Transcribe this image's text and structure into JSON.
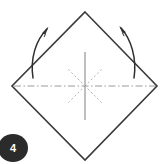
{
  "figure": {
    "kind": "origami-fold-diagram",
    "step_number": "4",
    "canvas": {
      "width": 164,
      "height": 164,
      "background": "#ffffff"
    }
  },
  "colors": {
    "paper_outline": "#3a3a3a",
    "crease_solid": "#8a8a8a",
    "crease_dashdot": "#9a9a9a",
    "crease_dotted": "#b4b4b4",
    "arrow": "#2e2e2e",
    "badge_fill": "#2b2b2b",
    "badge_text": "#ffffff"
  },
  "paper": {
    "label": "square-paper-diamond-orientation",
    "vertices": {
      "top": {
        "x": 85,
        "y": 12
      },
      "right": {
        "x": 157,
        "y": 86
      },
      "bottom": {
        "x": 85,
        "y": 160
      },
      "left": {
        "x": 12,
        "y": 86
      }
    },
    "path": "M 85 12 L 157 86 L 85 160 L 12 86 Z",
    "stroke_width": 1.6
  },
  "creases": {
    "center": {
      "x": 85,
      "y": 86
    },
    "vertical": {
      "label": "vertical-crease-line",
      "style": "solid",
      "x1": 85,
      "y1": 52,
      "x2": 85,
      "y2": 120,
      "stroke_width": 1.1
    },
    "horizontal": {
      "label": "horizontal-crease-line",
      "style": "dash-dot",
      "x1": 14,
      "y1": 86,
      "x2": 156,
      "y2": 86,
      "stroke_width": 1.0,
      "dash_pattern": "7,2.5,1.5,2.5"
    },
    "diagonals": [
      {
        "label": "diagonal-crease-nw",
        "style": "dotted",
        "x1": 85,
        "y1": 86,
        "x2": 68,
        "y2": 69
      },
      {
        "label": "diagonal-crease-ne",
        "style": "dotted",
        "x1": 85,
        "y1": 86,
        "x2": 102,
        "y2": 69
      },
      {
        "label": "diagonal-crease-sw",
        "style": "dotted",
        "x1": 85,
        "y1": 86,
        "x2": 68,
        "y2": 103
      },
      {
        "label": "diagonal-crease-se",
        "style": "dotted",
        "x1": 85,
        "y1": 86,
        "x2": 102,
        "y2": 103
      }
    ],
    "diagonal_stroke_width": 1.0,
    "diagonal_dash_pattern": "1.2,3.2"
  },
  "arrows": [
    {
      "label": "fold-arrow-left",
      "direction": "up-and-outward",
      "path": "M 33 78 C 30 58 36 40 47 29",
      "tip": {
        "x": 47,
        "y": 28
      },
      "head_angle_deg": -42,
      "stroke_width": 1.5
    },
    {
      "label": "fold-arrow-right",
      "direction": "up-and-outward",
      "path": "M 134 78 C 137 58 131 39 121 28",
      "tip": {
        "x": 120,
        "y": 27
      },
      "head_angle_deg": 222,
      "stroke_width": 1.5
    }
  ],
  "step_badge": {
    "label": "4",
    "center": {
      "x": 13,
      "y": 148
    },
    "radius_x": 15,
    "radius_y": 14
  }
}
